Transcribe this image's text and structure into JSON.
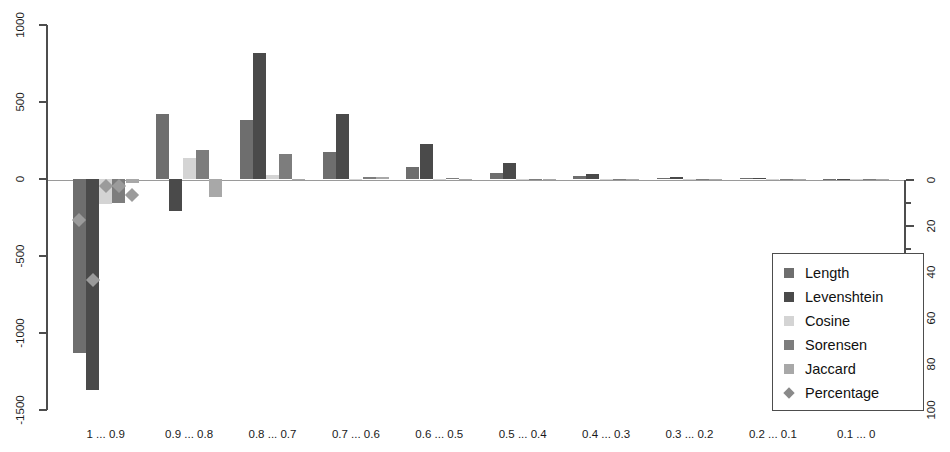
{
  "chart_data": {
    "type": "bar",
    "title": "",
    "subtitle": "",
    "xlabel": "",
    "ylabel": "",
    "grid": false,
    "legend_position": "bottom-right",
    "categories": [
      "1 ... 0.9",
      "0.9 ... 0.8",
      "0.8 ... 0.7",
      "0.7 ... 0.6",
      "0.6 ... 0.5",
      "0.5 ... 0.4",
      "0.4 ... 0.3",
      "0.3 ... 0.2",
      "0.2 ... 0.1",
      "0.1 ... 0"
    ],
    "left_axis": {
      "ylim": [
        -1500,
        1000
      ],
      "ticks": [
        1000,
        500,
        0,
        -500,
        -1000,
        -1500
      ],
      "tick_labels": [
        "1000",
        "500",
        "0",
        "-500",
        "-1000",
        "-1500"
      ]
    },
    "right_axis": {
      "ylim": [
        0,
        100
      ],
      "inverted": true,
      "ticks": [
        0,
        20,
        40,
        60,
        80,
        100
      ],
      "tick_labels": [
        "0",
        "20",
        "40",
        "60",
        "80",
        "100"
      ],
      "minor_ticks": [
        10,
        30,
        50,
        70,
        90
      ]
    },
    "series": [
      {
        "name": "Length",
        "color": "#6e6e6e",
        "type": "bar",
        "values": [
          -1130,
          425,
          385,
          175,
          75,
          40,
          22,
          8,
          4,
          2
        ]
      },
      {
        "name": "Levenshtein",
        "color": "#4a4a4a",
        "type": "bar",
        "values": [
          -1370,
          -210,
          820,
          425,
          225,
          105,
          32,
          12,
          5,
          2
        ]
      },
      {
        "name": "Cosine",
        "color": "#d4d4d4",
        "type": "bar",
        "values": [
          -165,
          135,
          25,
          3,
          2,
          1,
          1,
          0,
          0,
          0
        ]
      },
      {
        "name": "Sorensen",
        "color": "#7d7d7d",
        "type": "bar",
        "values": [
          -155,
          190,
          160,
          15,
          4,
          2,
          1,
          0,
          0,
          0
        ]
      },
      {
        "name": "Jaccard",
        "color": "#a8a8a8",
        "type": "bar",
        "values": [
          -28,
          -120,
          -4,
          10,
          3,
          2,
          1,
          0,
          0,
          0
        ]
      },
      {
        "name": "Percentage",
        "color": "#8a8a8a",
        "type": "marker",
        "axis": "right",
        "values": [
          2.5,
          4.5,
          0,
          0,
          0,
          0,
          0,
          0,
          0,
          0
        ],
        "point_left_values": [
          -265,
          -655,
          -45,
          -105,
          0,
          0,
          0,
          0,
          0,
          0
        ]
      }
    ],
    "markers": [
      {
        "category_index": 0,
        "series_index": 0,
        "left_value": -265
      },
      {
        "category_index": 0,
        "series_index": 1,
        "left_value": -655
      },
      {
        "category_index": 0,
        "series_index": 2,
        "left_value": -45
      },
      {
        "category_index": 0,
        "series_index": 3,
        "left_value": -45
      },
      {
        "category_index": 0,
        "series_index": 4,
        "left_value": -105
      }
    ]
  },
  "legend": {
    "items": [
      {
        "label": "Length",
        "swatch": "square",
        "color": "#6e6e6e"
      },
      {
        "label": "Levenshtein",
        "swatch": "square",
        "color": "#4a4a4a"
      },
      {
        "label": "Cosine",
        "swatch": "square",
        "color": "#d4d4d4"
      },
      {
        "label": "Sorensen",
        "swatch": "square",
        "color": "#7d7d7d"
      },
      {
        "label": "Jaccard",
        "swatch": "square",
        "color": "#a8a8a8"
      },
      {
        "label": "Percentage",
        "swatch": "diamond",
        "color": "#8a8a8a"
      }
    ]
  }
}
